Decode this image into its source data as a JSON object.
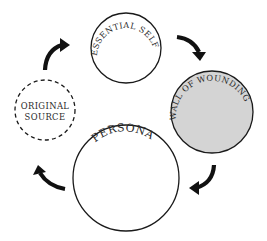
{
  "diagram": {
    "type": "cycle",
    "nodes": [
      {
        "id": "essential-self",
        "label": "ESSENTIAL SELF",
        "fill": "#ffffff",
        "border": "solid"
      },
      {
        "id": "wall-of-wounding",
        "label": "WALL OF WOUNDING",
        "fill": "#d4d4d4",
        "border": "solid"
      },
      {
        "id": "persona",
        "label": "PERSONA",
        "fill": "#ffffff",
        "border": "solid"
      },
      {
        "id": "original-source",
        "label_lines": [
          "ORIGINAL",
          "SOURCE"
        ],
        "fill": "#ffffff",
        "border": "dashed"
      }
    ],
    "edges": [
      {
        "from": "original-source",
        "to": "essential-self"
      },
      {
        "from": "essential-self",
        "to": "wall-of-wounding"
      },
      {
        "from": "wall-of-wounding",
        "to": "persona"
      },
      {
        "from": "persona",
        "to": "original-source"
      }
    ],
    "colors": {
      "stroke": "#1a1a1a",
      "arrow": "#111111",
      "shaded": "#d4d4d4"
    }
  }
}
